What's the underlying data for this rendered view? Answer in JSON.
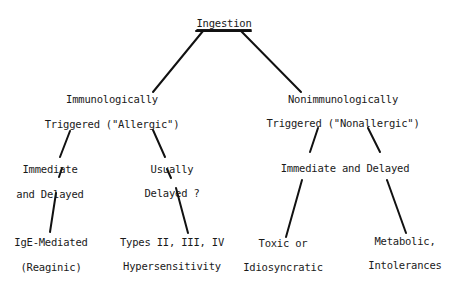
{
  "diagram": {
    "root": "Ingestion",
    "left": {
      "line1": "Immunologically",
      "line2": "Triggered (\"Allergic\")",
      "children": [
        {
          "line1": "Immediate",
          "line2": "and Delayed",
          "leaf1": "IgE-Mediated",
          "leaf2": "(Reaginic)"
        },
        {
          "line1": "Usually",
          "line2": "Delayed ?",
          "leaf1": "Types II, III, IV",
          "leaf2": "Hypersensitivity"
        }
      ]
    },
    "right": {
      "line1": "Nonimmunologically",
      "line2": "Triggered (\"Nonallergic\")",
      "mid": "Immediate and Delayed",
      "children": [
        {
          "leaf1": "Toxic or",
          "leaf2": "Idiosyncratic"
        },
        {
          "leaf1": "Metabolic,",
          "leaf2": "Intolerances"
        }
      ]
    }
  }
}
